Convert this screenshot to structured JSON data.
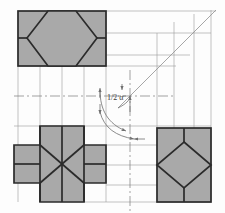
{
  "drawing": {
    "title": "Orthographic projection construction",
    "annotation_label": "1/2 α",
    "background_color": "#fdfdfd",
    "fill_color": "#a9a9a9",
    "outline_color": "#2b2b2b",
    "construction_color": "#8a8a8a",
    "center_line_color": "#7a7a7a",
    "miter_line_label": "45° miter line"
  },
  "views": [
    {
      "name": "top-left-view",
      "description": "Rectangle with inscribed hexagon",
      "x": 18,
      "y": 11,
      "width": 88,
      "height": 55,
      "shape": "hexagon-in-rectangle"
    },
    {
      "name": "bottom-left-view",
      "description": "Cross (plus) shape with chamfers",
      "x": 14,
      "y": 126,
      "width": 92,
      "height": 76,
      "shape": "cross-with-chamfers"
    },
    {
      "name": "bottom-right-view",
      "description": "Rectangle with inscribed diamond",
      "x": 157,
      "y": 128,
      "width": 54,
      "height": 74,
      "shape": "diamond-in-rectangle"
    }
  ],
  "construction": {
    "miter_origin_x": 130,
    "miter_origin_y": 96,
    "miter_end_x": 216,
    "miter_end_y": 10,
    "horizontal_center_y": 96,
    "vertical_center_x": 130
  },
  "annotation": {
    "text": "1/2 α",
    "x": 108,
    "y": 98,
    "arc_count": 2,
    "arrow_count": 4
  }
}
